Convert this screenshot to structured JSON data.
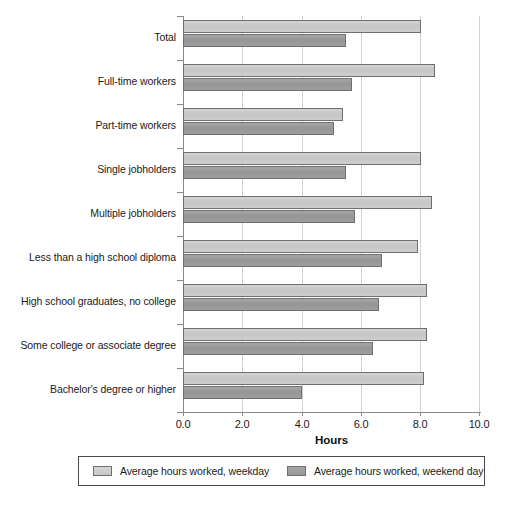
{
  "chart_data": {
    "type": "bar",
    "orientation": "horizontal",
    "title": "",
    "xlabel": "Hours",
    "ylabel": "",
    "xlim": [
      0.0,
      10.0
    ],
    "xticks": [
      "0.0",
      "2.0",
      "4.0",
      "6.0",
      "8.0",
      "10.0"
    ],
    "xtick_values": [
      0.0,
      2.0,
      4.0,
      6.0,
      8.0,
      10.0
    ],
    "grid": true,
    "legend_position": "below-axis",
    "categories": [
      "Total",
      "Full-time workers",
      "Part-time workers",
      "Single jobholders",
      "Multiple jobholders",
      "Less than a high school diploma",
      "High school graduates, no college",
      "Some college or associate degree",
      "Bachelor's degree or higher"
    ],
    "series": [
      {
        "name": "Average hours worked, weekday",
        "color": "#c9c9c9",
        "values": [
          8.0,
          8.5,
          5.4,
          8.0,
          8.4,
          7.9,
          8.2,
          8.2,
          8.1
        ]
      },
      {
        "name": "Average hours worked, weekend day",
        "color": "#9a9a9a",
        "values": [
          5.5,
          5.7,
          5.1,
          5.5,
          5.8,
          6.7,
          6.6,
          6.4,
          4.0
        ]
      }
    ]
  },
  "legend": {
    "entries": [
      {
        "label": "Average hours worked, weekday",
        "swatch": "weekday"
      },
      {
        "label": "Average hours worked, weekend day",
        "swatch": "weekend"
      }
    ]
  }
}
